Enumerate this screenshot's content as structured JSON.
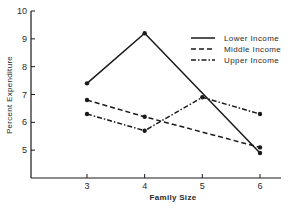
{
  "chart_data": {
    "type": "line",
    "title": "",
    "xlabel": "Family Size",
    "ylabel": "Percent Expenditure",
    "x": [
      3,
      4,
      5,
      6
    ],
    "xlim": [
      2,
      6.35
    ],
    "ylim": [
      4,
      10
    ],
    "xticks": [
      "3",
      "4",
      "5",
      "6"
    ],
    "yticks": [
      "5",
      "6",
      "7",
      "8",
      "9",
      "10"
    ],
    "grid": false,
    "legend_position": "upper right",
    "series": [
      {
        "name": "Lower Income",
        "style": "solid",
        "x": [
          3,
          4,
          6
        ],
        "values": [
          7.4,
          9.2,
          4.9
        ]
      },
      {
        "name": "Middle Income",
        "style": "dashed",
        "x": [
          3,
          4,
          6
        ],
        "values": [
          6.8,
          6.2,
          5.1
        ]
      },
      {
        "name": "Upper Income",
        "style": "dashdot",
        "x": [
          3,
          4,
          5,
          6
        ],
        "values": [
          6.3,
          5.7,
          6.9,
          6.3
        ]
      }
    ]
  },
  "legend": [
    {
      "label": "Lower Income",
      "dash": ""
    },
    {
      "label": "Middle Income",
      "dash": "5,3"
    },
    {
      "label": "Upper Income",
      "dash": "5,2,1.5,2"
    }
  ],
  "colors": {
    "ink": "#1a1a1a",
    "background": "#ffffff"
  }
}
